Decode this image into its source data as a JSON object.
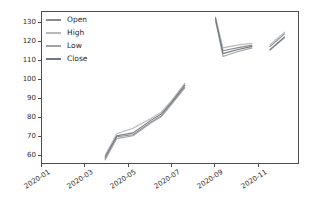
{
  "figure": {
    "background": "#ffffff",
    "spine_color": "#4d4d4d",
    "tick_label_color": "#2e2e2e"
  },
  "chart_data": {
    "type": "line",
    "title": "",
    "xlabel": "",
    "ylabel": "",
    "grid": false,
    "x_unit": "months-since-2020-01",
    "xlim": [
      0,
      11.9
    ],
    "ylim": [
      55,
      136
    ],
    "yticks": [
      60,
      70,
      80,
      90,
      100,
      110,
      120,
      130
    ],
    "xticks": [
      {
        "pos": 0,
        "label": "2020-01"
      },
      {
        "pos": 2,
        "label": "2020-03"
      },
      {
        "pos": 4,
        "label": "2020-05"
      },
      {
        "pos": 6,
        "label": "2020-07"
      },
      {
        "pos": 8,
        "label": "2020-09"
      },
      {
        "pos": 10,
        "label": "2020-11"
      }
    ],
    "legend": {
      "position": "upper-left",
      "frame": false,
      "entries": [
        "Open",
        "High",
        "Low",
        "Close"
      ]
    },
    "series": [
      {
        "name": "Open",
        "color": "#8b8b8b",
        "segments": [
          [
            [
              2.9,
              58
            ],
            [
              3.45,
              70
            ],
            [
              4.2,
              71
            ],
            [
              5.0,
              77.5
            ],
            [
              5.5,
              81
            ],
            [
              6.0,
              88
            ],
            [
              6.6,
              96.5
            ]
          ],
          [
            [
              8.0,
              132
            ],
            [
              8.35,
              115.5
            ],
            [
              9.0,
              117
            ],
            [
              9.7,
              118.5
            ]
          ],
          [
            [
              10.5,
              117.5
            ],
            [
              11.2,
              124.5
            ]
          ]
        ]
      },
      {
        "name": "High",
        "color": "#b8b8b8",
        "segments": [
          [
            [
              2.9,
              60
            ],
            [
              3.45,
              71.5
            ],
            [
              4.2,
              74.5
            ],
            [
              5.0,
              79.5
            ],
            [
              5.5,
              83
            ],
            [
              6.0,
              89.5
            ],
            [
              6.6,
              98.5
            ]
          ],
          [
            [
              8.0,
              133.5
            ],
            [
              8.35,
              117
            ],
            [
              9.0,
              118.5
            ],
            [
              9.7,
              119.5
            ]
          ],
          [
            [
              10.5,
              118.5
            ],
            [
              11.2,
              125.5
            ]
          ]
        ]
      },
      {
        "name": "Low",
        "color": "#a3a3a3",
        "segments": [
          [
            [
              2.9,
              57.5
            ],
            [
              3.45,
              69
            ],
            [
              4.2,
              70.5
            ],
            [
              5.0,
              77
            ],
            [
              5.5,
              80.5
            ],
            [
              6.0,
              87.5
            ],
            [
              6.6,
              96
            ]
          ],
          [
            [
              8.0,
              131.5
            ],
            [
              8.35,
              112.5
            ],
            [
              9.0,
              115
            ],
            [
              9.7,
              117
            ]
          ],
          [
            [
              10.5,
              115.5
            ],
            [
              11.2,
              122.5
            ]
          ]
        ]
      },
      {
        "name": "Close",
        "color": "#6f7884",
        "segments": [
          [
            [
              2.9,
              59
            ],
            [
              3.45,
              70.5
            ],
            [
              4.2,
              72
            ],
            [
              5.0,
              78.5
            ],
            [
              5.5,
              82
            ],
            [
              6.0,
              88.5
            ],
            [
              6.6,
              97.5
            ]
          ],
          [
            [
              8.0,
              133
            ],
            [
              8.35,
              114
            ],
            [
              9.0,
              116
            ],
            [
              9.7,
              117.8
            ]
          ],
          [
            [
              10.5,
              116
            ],
            [
              11.2,
              123
            ]
          ]
        ]
      }
    ]
  }
}
